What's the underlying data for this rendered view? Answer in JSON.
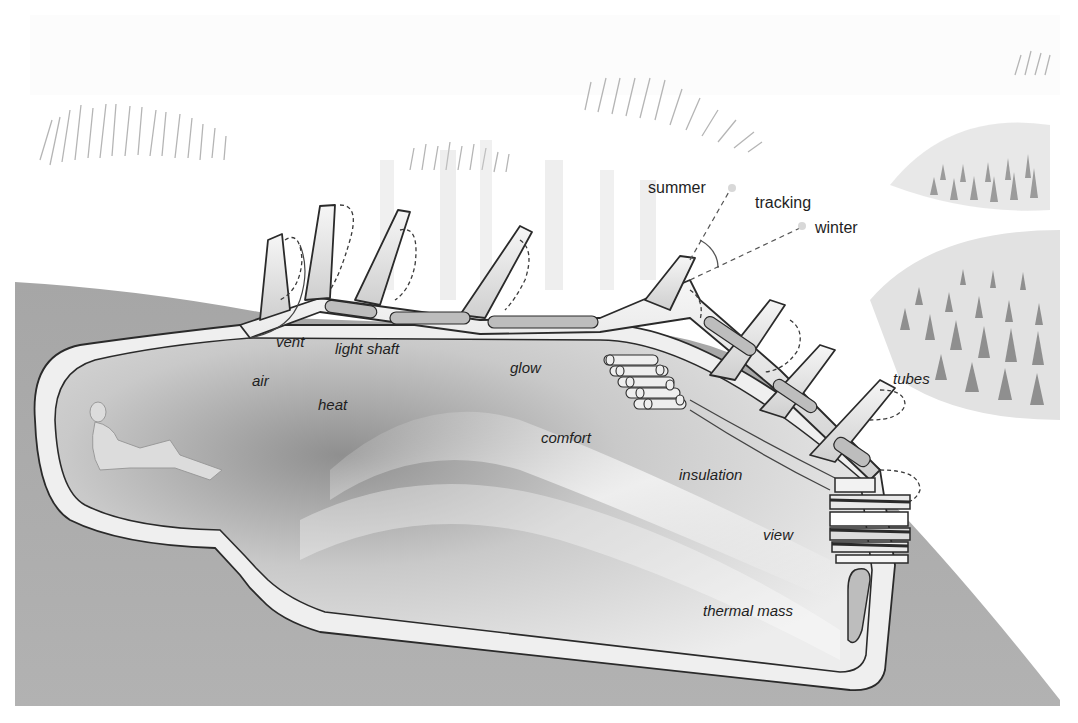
{
  "diagram": {
    "type": "architectural-section",
    "colors": {
      "background": "#ffffff",
      "ground": "#a9a9a9",
      "shell": "#efefef",
      "interior_light": "#e4e4e4",
      "interior_dark": "#9c9c9c",
      "outline": "#2a2a2a",
      "text": "#1e1e1e"
    },
    "labels": {
      "summer": "summer",
      "tracking": "tracking",
      "winter": "winter",
      "vent": "vent",
      "light_shaft": "light shaft",
      "air": "air",
      "heat": "heat",
      "glow": "glow",
      "comfort": "comfort",
      "insulation": "insulation",
      "tubes": "tubes",
      "view": "view",
      "thermal_mass": "thermal mass"
    },
    "elements": [
      {
        "name": "seated-figure",
        "description": "Reclining human figure at the rear of the cave"
      },
      {
        "name": "roof-tubes",
        "description": "Angled light-collecting tubes protruding from the roof"
      },
      {
        "name": "tube-stack",
        "description": "Cluster of stacked cylindrical tubes in the ceiling"
      },
      {
        "name": "window-layers",
        "description": "Layered glazing at the front opening"
      },
      {
        "name": "sun-angle-lines",
        "description": "Dashed lines indicating summer and winter sun angles with tracking arc"
      },
      {
        "name": "vegetation-clusters",
        "description": "Sketched grass/reed clumps on the surface"
      }
    ]
  }
}
